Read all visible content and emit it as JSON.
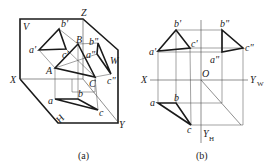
{
  "figure_a": {
    "caption": "(a)",
    "planes": {
      "V": "V",
      "H": "H",
      "W": "W"
    },
    "axes": {
      "X": "X",
      "Y": "Y",
      "Z": "Z"
    },
    "space_points": {
      "A": "A",
      "B": "B",
      "C": "C"
    },
    "front_view": {
      "a": "a'",
      "b": "b'",
      "c": "c'"
    },
    "side_view": {
      "a": "a\"",
      "b": "b\"",
      "c": "c\""
    },
    "top_view": {
      "a": "a",
      "b": "b",
      "c": "c"
    }
  },
  "figure_b": {
    "caption": "(b)",
    "axes": {
      "X": "X",
      "O": "O",
      "YW": "Y",
      "YW_sub": "W",
      "YH": "Y",
      "YH_sub": "H"
    },
    "front_view": {
      "a": "a'",
      "b": "b'",
      "c": "c'"
    },
    "side_view": {
      "a": "a\"",
      "b": "b\"",
      "c": "c\""
    },
    "top_view": {
      "a": "a",
      "b": "b",
      "c": "c"
    }
  },
  "colors": {
    "line": "#1a1a1a",
    "thin": "#444444",
    "background": "#ffffff"
  }
}
